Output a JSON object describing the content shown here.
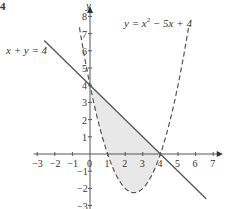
{
  "question_number": "4",
  "chart_data": {
    "type": "line",
    "title": "",
    "xlabel": "",
    "ylabel": "y",
    "xlim": [
      -3,
      7
    ],
    "ylim": [
      -3,
      8
    ],
    "x_ticks": [
      -3,
      -2,
      -1,
      0,
      1,
      2,
      3,
      4,
      5,
      6,
      7
    ],
    "y_ticks": [
      -3,
      -2,
      -1,
      1,
      2,
      3,
      4,
      5,
      6,
      7,
      8
    ],
    "grid": false,
    "series": [
      {
        "name": "x + y = 4",
        "style": "solid",
        "equation": "y = 4 - x",
        "x_range": [
          -2.6,
          6.6
        ]
      },
      {
        "name": "y = x^2 - 5x + 4",
        "style": "dashed",
        "equation": "y = x^2 - 5x + 4",
        "x_range": [
          -0.6,
          5.6
        ]
      }
    ],
    "shaded_region": {
      "between": [
        "x + y = 4",
        "y = x^2 - 5x + 4"
      ],
      "x_range": [
        0,
        4
      ]
    },
    "annotations": [
      "x + y = 4",
      "y = x^2 - 5x + 4"
    ]
  },
  "labels": {
    "line": "x + y = 4",
    "parabola_y": "y = x",
    "parabola_rest": " − 5x + 4",
    "y_axis": "y"
  }
}
